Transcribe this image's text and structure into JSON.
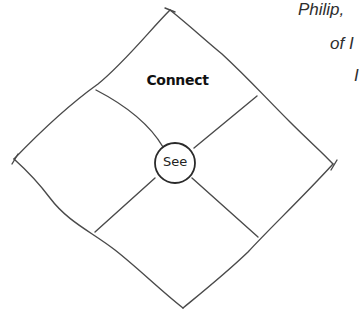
{
  "diagram": {
    "center_label": "See",
    "top_quadrant_label": "Connect",
    "stroke_color": "#4a4a4a",
    "background": "#ffffff"
  },
  "side_text": {
    "lines": [
      "Philip,",
      "of I",
      "I"
    ]
  }
}
